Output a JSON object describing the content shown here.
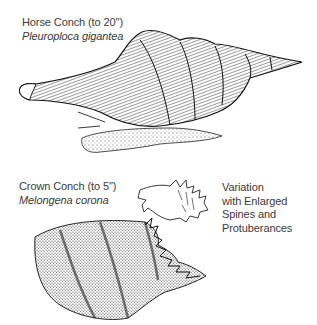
{
  "horse_conch": {
    "common_name": "Horse Conch (to 20\")",
    "scientific_name": "Pleuroploca gigantea"
  },
  "crown_conch": {
    "common_name": "Crown Conch (to 5\")",
    "scientific_name": "Melongena corona"
  },
  "variation": {
    "lines": [
      "Variation",
      "with Enlarged",
      "Spines and",
      "Protuberances"
    ]
  },
  "colors": {
    "ink": "#1a1a1a",
    "text": "#3a3a3a",
    "background": "#ffffff"
  }
}
